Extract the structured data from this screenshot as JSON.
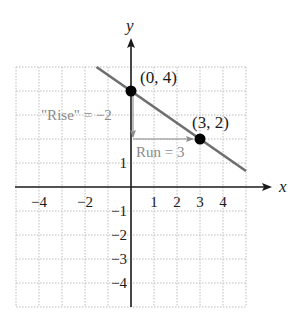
{
  "figure": {
    "axis_labels": {
      "x": "x",
      "y": "y"
    },
    "x_ticks": [
      {
        "value": -4,
        "label": "−4"
      },
      {
        "value": -2,
        "label": "−2"
      },
      {
        "value": 1,
        "label": "1"
      },
      {
        "value": 2,
        "label": "2"
      },
      {
        "value": 3,
        "label": "3"
      },
      {
        "value": 4,
        "label": "4"
      }
    ],
    "y_ticks": [
      {
        "value": 1,
        "label": "1"
      },
      {
        "value": -1,
        "label": "−1"
      },
      {
        "value": -2,
        "label": "−2"
      },
      {
        "value": -3,
        "label": "−3"
      },
      {
        "value": -4,
        "label": "−4"
      }
    ],
    "points": [
      {
        "x": 0,
        "y": 4,
        "label": "(0, 4)"
      },
      {
        "x": 3,
        "y": 2,
        "label": "(3, 2)"
      }
    ],
    "annotations": {
      "rise": "\"Rise\" = −2",
      "run": "Run = 3"
    },
    "line": {
      "slope": "-2/3",
      "intercept": 4,
      "x_from": -1.5,
      "x_to": 5.0
    },
    "grid": {
      "x_range": [
        -5,
        5
      ],
      "y_range": [
        -5,
        5
      ],
      "style": "dotted"
    },
    "colors": {
      "axis": "#1a1a1a",
      "grid": "#bdbdbd",
      "line": "#6e6e6e",
      "annotation": "#8a8a8a",
      "point": "#000000"
    }
  }
}
